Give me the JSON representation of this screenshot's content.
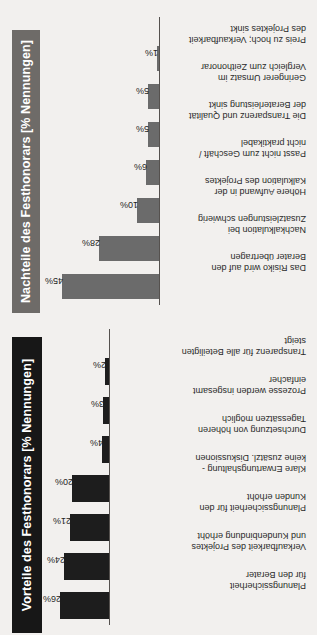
{
  "page": {
    "background": "#f2f0ee",
    "orientation": "rotated-90-ccw"
  },
  "charts": [
    {
      "id": "nachteile",
      "title": "Nachteile des Festhonorars [% Nennungen]",
      "title_box_color": "#6e6b68",
      "title_text_color": "#ffffff",
      "bar_color": "#6b6b6b",
      "axis_color": "#55514e",
      "chart_data": {
        "type": "bar",
        "title": "Nachteile des Festhonorars [% Nennungen]",
        "xlabel": "",
        "ylabel": "% Nennungen",
        "ylim": [
          0,
          50
        ],
        "grid": false,
        "legend": "none",
        "categories": [
          "Das Risiko wird auf den\nBerater übertragen",
          "Nachkalkulation bei\nZusatzleistungen schwierig",
          "Höhere Aufwand in der\nKalkulation des Projektes",
          "Passt nicht zum Geschäft /\nnicht praktikabel",
          "Die Transparenz und Qualität\nder Beraterleistung sinkt",
          "Geringerer Umsatz im\nVergleich zum Zeithonorar",
          "Preis zu hoch; Verkaufbarkeit\ndes Projektes sinkt"
        ],
        "values": [
          45,
          28,
          10,
          6,
          5,
          5,
          1
        ],
        "value_labels": [
          "45%",
          "28%",
          "10%",
          "6%",
          "5%",
          "5%",
          "1%"
        ]
      }
    },
    {
      "id": "vorteile",
      "title": "Vorteile des Festhonorars [% Nennungen]",
      "title_box_color": "#171717",
      "title_text_color": "#ffffff",
      "bar_color": "#1d1d1d",
      "axis_color": "#55514e",
      "chart_data": {
        "type": "bar",
        "title": "Vorteile des Festhonorars [% Nennungen]",
        "xlabel": "",
        "ylabel": "% Nennungen",
        "ylim": [
          0,
          30
        ],
        "grid": false,
        "legend": "none",
        "categories": [
          "Planungssicherheit\nfür den Berater",
          "Verkaufbarkeit des Projektes\nund Kundenbindung erhöht",
          "Planungssicherheit für den\nKunden erhöht",
          "Klare Erwartungshaltung -\nkeine zusätzl. Diskussionen",
          "Durchsetzung von höheren\nTagessätzen möglich",
          "Prozesse werden insgesamt\neinfacher",
          "Transparenz für alle Beteiligten\nsteigt"
        ],
        "values": [
          26,
          24,
          21,
          20,
          4,
          3,
          2
        ],
        "value_labels": [
          "26%",
          "24%",
          "21%",
          "20%",
          "4%",
          "3%",
          "2%"
        ]
      }
    }
  ]
}
